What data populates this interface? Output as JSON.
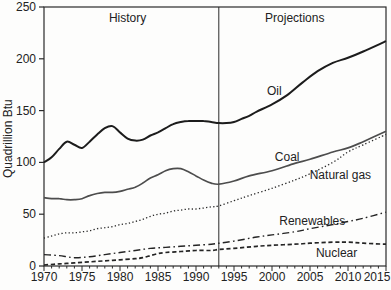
{
  "figure": {
    "background": "#fdfdfc",
    "axis_color": "#2a2a2a",
    "text_color": "#222222"
  },
  "chart_data": {
    "type": "line",
    "title": "",
    "xlabel": "",
    "ylabel": "Quadrillion Btu",
    "xlim": [
      1970,
      2015
    ],
    "ylim": [
      0,
      250
    ],
    "x_major_ticks": [
      1970,
      1975,
      1980,
      1985,
      1990,
      1995,
      2000,
      2005,
      2010,
      2015
    ],
    "x_minor_tick_interval": 1,
    "y_ticks": [
      0,
      50,
      100,
      150,
      200,
      250
    ],
    "grid": false,
    "plot_border": "box",
    "legend_position": "inline-labels",
    "divider": {
      "year": 1993
    },
    "annotations": [
      {
        "text": "History",
        "year": 1981,
        "value": 236
      },
      {
        "text": "Projections",
        "year": 2003,
        "value": 236
      }
    ],
    "series": [
      {
        "name": "Oil",
        "style": "solid",
        "color": "#1c1c1c",
        "width": 2,
        "label_anchor": {
          "year": 2000.3,
          "value": 169
        },
        "points": [
          [
            1970,
            100
          ],
          [
            1971,
            105
          ],
          [
            1972,
            113
          ],
          [
            1973,
            120
          ],
          [
            1974,
            117
          ],
          [
            1975,
            114
          ],
          [
            1976,
            120
          ],
          [
            1977,
            127
          ],
          [
            1978,
            133
          ],
          [
            1979,
            135
          ],
          [
            1980,
            129
          ],
          [
            1981,
            123
          ],
          [
            1982,
            121
          ],
          [
            1983,
            122
          ],
          [
            1984,
            126
          ],
          [
            1985,
            129
          ],
          [
            1986,
            133
          ],
          [
            1987,
            137
          ],
          [
            1988,
            139
          ],
          [
            1989,
            140
          ],
          [
            1990,
            140
          ],
          [
            1991,
            140
          ],
          [
            1992,
            139
          ],
          [
            1993,
            138
          ],
          [
            1994,
            138
          ],
          [
            1995,
            139
          ],
          [
            1996,
            142
          ],
          [
            1997,
            145
          ],
          [
            1998,
            149
          ],
          [
            2000,
            156
          ],
          [
            2002,
            165
          ],
          [
            2004,
            177
          ],
          [
            2006,
            188
          ],
          [
            2008,
            196
          ],
          [
            2010,
            201
          ],
          [
            2012,
            207
          ],
          [
            2015,
            217
          ]
        ]
      },
      {
        "name": "Coal",
        "style": "solid",
        "color": "#4d4d4d",
        "width": 1.7,
        "label_anchor": {
          "year": 2002,
          "value": 105
        },
        "points": [
          [
            1970,
            66
          ],
          [
            1971,
            65
          ],
          [
            1972,
            65
          ],
          [
            1973,
            64
          ],
          [
            1974,
            64
          ],
          [
            1975,
            65
          ],
          [
            1976,
            68
          ],
          [
            1977,
            70
          ],
          [
            1978,
            71
          ],
          [
            1979,
            71
          ],
          [
            1980,
            72
          ],
          [
            1981,
            74
          ],
          [
            1982,
            76
          ],
          [
            1983,
            80
          ],
          [
            1984,
            85
          ],
          [
            1985,
            88
          ],
          [
            1986,
            92
          ],
          [
            1987,
            94
          ],
          [
            1988,
            94
          ],
          [
            1989,
            91
          ],
          [
            1990,
            87
          ],
          [
            1991,
            83
          ],
          [
            1992,
            80
          ],
          [
            1993,
            79
          ],
          [
            1995,
            82
          ],
          [
            1997,
            87
          ],
          [
            2000,
            92
          ],
          [
            2003,
            99
          ],
          [
            2005,
            103
          ],
          [
            2008,
            110
          ],
          [
            2010,
            114
          ],
          [
            2012,
            120
          ],
          [
            2015,
            130
          ]
        ]
      },
      {
        "name": "Natural gas",
        "style": "dotted",
        "color": "#2a2a2a",
        "width": 1.3,
        "label_anchor": {
          "year": 2009,
          "value": 88
        },
        "points": [
          [
            1970,
            27
          ],
          [
            1971,
            29
          ],
          [
            1972,
            31
          ],
          [
            1973,
            32
          ],
          [
            1974,
            32
          ],
          [
            1975,
            33
          ],
          [
            1976,
            34
          ],
          [
            1977,
            36
          ],
          [
            1978,
            37
          ],
          [
            1979,
            38
          ],
          [
            1980,
            40
          ],
          [
            1981,
            41
          ],
          [
            1982,
            43
          ],
          [
            1983,
            45
          ],
          [
            1984,
            48
          ],
          [
            1985,
            50
          ],
          [
            1986,
            51
          ],
          [
            1987,
            53
          ],
          [
            1988,
            54
          ],
          [
            1989,
            55
          ],
          [
            1990,
            55
          ],
          [
            1991,
            56
          ],
          [
            1992,
            57
          ],
          [
            1993,
            58
          ],
          [
            1995,
            63
          ],
          [
            1997,
            68
          ],
          [
            2000,
            75
          ],
          [
            2003,
            83
          ],
          [
            2005,
            89
          ],
          [
            2008,
            100
          ],
          [
            2010,
            110
          ],
          [
            2012,
            117
          ],
          [
            2015,
            127
          ]
        ]
      },
      {
        "name": "Renewables",
        "style": "dash-dot",
        "color": "#242424",
        "width": 1.4,
        "label_anchor": {
          "year": 2005.3,
          "value": 43
        },
        "points": [
          [
            1970,
            11
          ],
          [
            1972,
            10
          ],
          [
            1974,
            8
          ],
          [
            1976,
            9
          ],
          [
            1978,
            11
          ],
          [
            1980,
            13
          ],
          [
            1982,
            15
          ],
          [
            1984,
            17
          ],
          [
            1986,
            18
          ],
          [
            1988,
            19
          ],
          [
            1990,
            20
          ],
          [
            1992,
            21
          ],
          [
            1993,
            22
          ],
          [
            1995,
            24
          ],
          [
            1998,
            28
          ],
          [
            2000,
            30
          ],
          [
            2003,
            33
          ],
          [
            2005,
            36
          ],
          [
            2008,
            40
          ],
          [
            2010,
            43
          ],
          [
            2012,
            46
          ],
          [
            2015,
            52
          ]
        ]
      },
      {
        "name": "Nuclear",
        "style": "dashed",
        "color": "#242424",
        "width": 1.7,
        "label_anchor": {
          "year": 2008.5,
          "value": 13
        },
        "points": [
          [
            1970,
            1
          ],
          [
            1972,
            2
          ],
          [
            1974,
            3
          ],
          [
            1976,
            4
          ],
          [
            1978,
            5
          ],
          [
            1980,
            6
          ],
          [
            1982,
            7
          ],
          [
            1983,
            8
          ],
          [
            1984,
            10
          ],
          [
            1985,
            12
          ],
          [
            1986,
            13
          ],
          [
            1988,
            14
          ],
          [
            1990,
            15
          ],
          [
            1992,
            15
          ],
          [
            1993,
            16
          ],
          [
            1995,
            17
          ],
          [
            1998,
            19
          ],
          [
            2000,
            20
          ],
          [
            2003,
            21
          ],
          [
            2005,
            22
          ],
          [
            2008,
            23
          ],
          [
            2010,
            23
          ],
          [
            2012,
            22
          ],
          [
            2015,
            21
          ]
        ]
      }
    ]
  }
}
